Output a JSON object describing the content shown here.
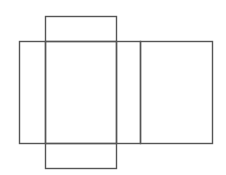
{
  "diagram": {
    "title": "",
    "stroke_color": "#555555",
    "background": "#ffffff",
    "shapes": [
      {
        "name": "top-flap",
        "x": 45,
        "y": 16,
        "w": 71,
        "h": 25
      },
      {
        "name": "left-side",
        "x": 19,
        "y": 41,
        "w": 26,
        "h": 102
      },
      {
        "name": "front-face",
        "x": 45,
        "y": 41,
        "w": 71,
        "h": 102
      },
      {
        "name": "right-side",
        "x": 116,
        "y": 41,
        "w": 24,
        "h": 102
      },
      {
        "name": "back-face",
        "x": 140,
        "y": 41,
        "w": 72,
        "h": 102
      },
      {
        "name": "bottom-flap",
        "x": 45,
        "y": 143,
        "w": 71,
        "h": 25
      }
    ]
  }
}
